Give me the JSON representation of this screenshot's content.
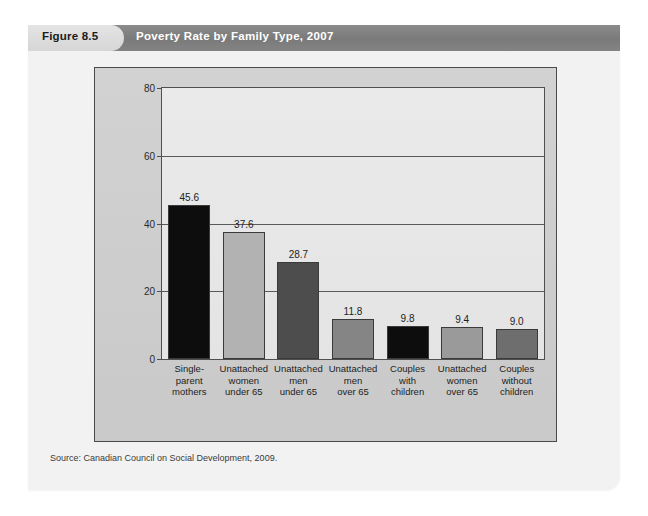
{
  "figure": {
    "tab_label": "Figure 8.5",
    "title": "Poverty Rate by Family Type, 2007",
    "source_note": "Source: Canadian Council on Social Development, 2009.",
    "tab_bg": "#dcdcdc",
    "title_bar_bg": "#7e7e7e",
    "title_color": "#ffffff",
    "panel_bg": "#f2f2f2",
    "chart_box_bg": "#cdcdcd",
    "plot_bg": "#e8e8e8"
  },
  "chart_data": {
    "type": "bar",
    "title": "Poverty Rate by Family Type, 2007",
    "xlabel": "",
    "ylabel": "Percentage of persons living in poverty",
    "ylim": [
      0,
      80
    ],
    "yticks": [
      0,
      20,
      40,
      60,
      80
    ],
    "grid": true,
    "legend": "none",
    "categories": [
      "Single-parent mothers",
      "Unattached women under 65",
      "Unattached men under 65",
      "Unattached men over 65",
      "Couples with children",
      "Unattached women over 65",
      "Couples without children"
    ],
    "category_lines": [
      [
        "Single-",
        "parent",
        "mothers"
      ],
      [
        "Unattached",
        "women",
        "under 65"
      ],
      [
        "Unattached",
        "men",
        "under 65"
      ],
      [
        "Unattached",
        "men",
        "over 65"
      ],
      [
        "Couples",
        "with",
        "children"
      ],
      [
        "Unattached",
        "women",
        "over 65"
      ],
      [
        "Couples",
        "without",
        "children"
      ]
    ],
    "values": [
      45.6,
      37.6,
      28.7,
      11.8,
      9.8,
      9.4,
      9.0
    ],
    "value_labels": [
      "45.6",
      "37.6",
      "28.7",
      "11.8",
      "9.8",
      "9.4",
      "9.0"
    ],
    "bar_colors": [
      "#0d0d0d",
      "#b2b2b2",
      "#4d4d4d",
      "#858585",
      "#0d0d0d",
      "#9a9a9a",
      "#6e6e6e"
    ]
  }
}
